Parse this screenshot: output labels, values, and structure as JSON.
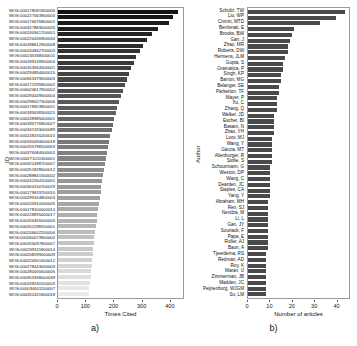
{
  "figure": {
    "panel_a_caption": "a)",
    "panel_b_caption": "b)"
  },
  "chart_data": [
    {
      "id": "panel-a",
      "type": "bar",
      "orientation": "horizontal",
      "title": "",
      "xlabel": "Times Cited",
      "ylabel": "ID",
      "xlim": [
        0,
        450
      ],
      "xticks": [
        0,
        100,
        200,
        300,
        400
      ],
      "grid": false,
      "legend": "none",
      "bar_color_scheme": "grayscale-gradient-dark-to-light",
      "categories": [
        "WOS:000178091900005",
        "WOS:000227063900003",
        "WOS:000176676800001",
        "WOS:000327883000026",
        "WOS:000240941700001",
        "WOS:000226436900034",
        "WOS:000188612900008",
        "WOS:000240842700003",
        "WOS:000245368400011",
        "WOS:000189149300004",
        "WOS:000163944500001",
        "WOS:000294854400015",
        "WOS:000943379000005",
        "WOS:000172295800002",
        "WOS:000024617900002",
        "WOS:000294449500004",
        "WOS:000299027300006",
        "WOS:000178923800001",
        "WOS:000185638300021",
        "WOS:000248985000001",
        "WOS:000185776800027",
        "WOS:000341333000089",
        "WOS:000248155200015",
        "WOS:000330094000018",
        "WOS:000255798100053",
        "WOS:000376084000001",
        "WOS:000271011300001",
        "WOS:000322498700007",
        "WOS:000251828600012",
        "WOS:000288841500002",
        "WOS:000242264100001",
        "WOS:000304150700029",
        "WOS:000179633700010",
        "WOS:000299164800003",
        "WOS:000245910000005",
        "WOS:000178100000014",
        "WOS:000228835400017",
        "WOS:000265455000005",
        "WOS:000261298200001",
        "WOS:000246602200004",
        "WOS:000260073900002",
        "WOS:000265037800007",
        "WOS:000259115900014",
        "WOS:000208299000009",
        "WOS:000224551600012",
        "WOS:000278443000003",
        "WOS:000280055500005",
        "WOS:000303358000039",
        "WOS:000249240100003",
        "WOS:000034601100007",
        "WOS:000262431800018"
      ],
      "values": [
        432,
        415,
        398,
        361,
        340,
        320,
        307,
        296,
        280,
        272,
        262,
        255,
        248,
        240,
        233,
        226,
        220,
        214,
        208,
        203,
        198,
        193,
        188,
        184,
        180,
        176,
        172,
        168,
        165,
        162,
        159,
        156,
        153,
        150,
        147,
        144,
        141,
        139,
        136,
        134,
        131,
        129,
        127,
        125,
        123,
        121,
        119,
        117,
        115,
        113,
        111
      ]
    },
    {
      "id": "panel-b",
      "type": "bar",
      "orientation": "horizontal",
      "title": "",
      "xlabel": "Number of articles",
      "ylabel": "Author",
      "xlim": [
        0,
        46
      ],
      "xticks": [
        0,
        10,
        20,
        30,
        40
      ],
      "grid": false,
      "legend": "none",
      "bar_color_scheme": "uniform-dark-gray",
      "categories": [
        "Schultz, TW",
        "Liu, WP",
        "Cronin, MTD",
        "Benfenati, E",
        "Brooks, BW",
        "Gan, J",
        "Zhao, MR",
        "Roberts, DW",
        "Hermens, JLM",
        "Gupta, S",
        "Gramatica, P",
        "Singh, KP",
        "Barron, MG",
        "Belanger, SE",
        "Parkerton, TF",
        "Mayer, P",
        "Xu, C",
        "Zhang, Q",
        "Walker, JD",
        "Escher, BI",
        "Basant, N",
        "Zhao, YH",
        "Lvov, MJ",
        "Wang, Y",
        "Garcia, MT",
        "Altenburger, R",
        "Stolte, S",
        "Schuurmann, G",
        "Weston, DP",
        "Wang, C",
        "Dearden, JC",
        "Staples, CA",
        "Yang, Y",
        "Abraham, MH",
        "Ren, SJ",
        "Nendza, M",
        "Li, L",
        "Gan, JY",
        "Souriack, F",
        "Papa, E",
        "Roller, AJ",
        "Baun, A",
        "Tjeerdema, RS",
        "Redman, AD",
        "Roy, K",
        "Maran, U",
        "Zimmerman, JB",
        "Madden, JC",
        "Peijnenburg, WJGM",
        "Su, LM"
      ],
      "values": [
        44,
        40,
        33,
        21,
        20,
        19,
        18,
        18,
        17,
        16,
        16,
        15,
        15,
        14,
        14,
        13,
        13,
        13,
        12,
        12,
        12,
        12,
        11,
        11,
        11,
        11,
        11,
        10,
        10,
        10,
        10,
        10,
        10,
        9,
        9,
        9,
        9,
        9,
        9,
        9,
        9,
        9,
        8,
        8,
        8,
        8,
        8,
        8,
        8,
        8
      ]
    }
  ]
}
